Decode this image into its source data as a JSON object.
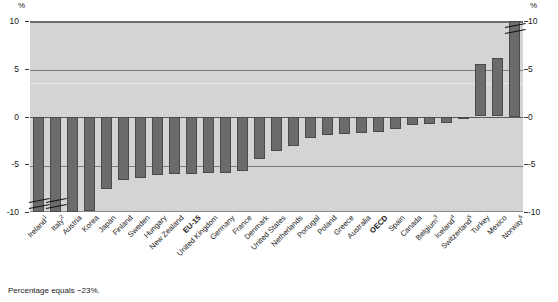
{
  "chart_data": {
    "type": "bar",
    "title": "",
    "xlabel": "",
    "ylabel": "%",
    "ylim": [
      -10,
      10
    ],
    "yticks": [
      10,
      5,
      0,
      -5,
      -10
    ],
    "ytick_labels": [
      "10",
      "5",
      "0",
      "-5",
      "-10"
    ],
    "grid": true,
    "legend": null,
    "axis_unit_left": "%",
    "axis_unit_right": "%",
    "orientation": "vertical",
    "sorted": "ascending",
    "note": "Two bars (Ireland, Italy) and one bar (Norway) exceed the plotted axis range and are drawn with axis-break marks.",
    "categories": [
      "Ireland",
      "Italy",
      "Austria",
      "Korea",
      "Japan",
      "Finland",
      "Sweden",
      "Hungary",
      "New Zealand",
      "EU-15",
      "United Kingdom",
      "Germany",
      "France",
      "Denmark",
      "United States",
      "Netherlands",
      "Portugal",
      "Poland",
      "Greece",
      "Australia",
      "OECD",
      "Spain",
      "Canada",
      "Belgium",
      "Iceland",
      "Switzerland",
      "Turkey",
      "Mexico",
      "Norway"
    ],
    "category_footnotes": {
      "Ireland": "1",
      "Italy": "2",
      "Belgium": "3",
      "Iceland": "4",
      "Switzerland": "5",
      "Norway": "6"
    },
    "highlighted_categories": [
      "EU-15",
      "OECD"
    ],
    "values": [
      -23.0,
      -12.5,
      -10.0,
      -9.9,
      -7.6,
      -6.7,
      -6.4,
      -6.1,
      -6.0,
      -6.0,
      -5.9,
      -5.9,
      -5.7,
      -4.4,
      -3.6,
      -3.1,
      -2.3,
      -1.9,
      -1.8,
      -1.7,
      -1.6,
      -1.3,
      -0.9,
      -0.8,
      -0.7,
      -0.2,
      5.5,
      6.1,
      10.6
    ],
    "clipped_bars": [
      "Ireland",
      "Italy",
      "Norway"
    ]
  },
  "footnote": {
    "text": "Percentage equals −23%."
  },
  "axis": {
    "percent_symbol": "%"
  }
}
